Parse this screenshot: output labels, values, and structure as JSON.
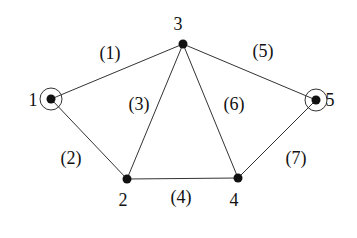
{
  "diagram": {
    "type": "graph",
    "nodes": [
      {
        "id": "1",
        "label": "1",
        "x": 51,
        "y": 99,
        "circled": true,
        "label_x": 33,
        "label_y": 106
      },
      {
        "id": "2",
        "label": "2",
        "x": 127,
        "y": 179,
        "circled": false,
        "label_x": 123,
        "label_y": 206
      },
      {
        "id": "3",
        "label": "3",
        "x": 183,
        "y": 44,
        "circled": false,
        "label_x": 178,
        "label_y": 30
      },
      {
        "id": "4",
        "label": "4",
        "x": 238,
        "y": 178,
        "circled": false,
        "label_x": 234,
        "label_y": 206
      },
      {
        "id": "5",
        "label": "5",
        "x": 316,
        "y": 100,
        "circled": true,
        "label_x": 330,
        "label_y": 106
      }
    ],
    "edges": [
      {
        "id": "1",
        "label": "(1)",
        "from": "1",
        "to": "3",
        "label_x": 110,
        "label_y": 59
      },
      {
        "id": "2",
        "label": "(2)",
        "from": "1",
        "to": "2",
        "label_x": 71,
        "label_y": 164
      },
      {
        "id": "3",
        "label": "(3)",
        "from": "3",
        "to": "2",
        "label_x": 139,
        "label_y": 110
      },
      {
        "id": "4",
        "label": "(4)",
        "from": "2",
        "to": "4",
        "label_x": 181,
        "label_y": 203
      },
      {
        "id": "5",
        "label": "(5)",
        "from": "3",
        "to": "5",
        "label_x": 263,
        "label_y": 57
      },
      {
        "id": "6",
        "label": "(6)",
        "from": "3",
        "to": "4",
        "label_x": 234,
        "label_y": 110
      },
      {
        "id": "7",
        "label": "(7)",
        "from": "5",
        "to": "4",
        "label_x": 296,
        "label_y": 164
      }
    ],
    "colors": {
      "line": "#333333",
      "node": "#111111",
      "text": "#111111",
      "background": "#ffffff"
    }
  }
}
